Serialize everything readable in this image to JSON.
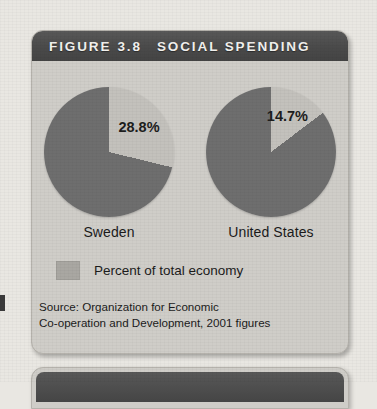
{
  "figure": {
    "header": {
      "prefix": "FIGURE",
      "number": "3.8",
      "title": "SOCIAL SPENDING"
    },
    "legend": {
      "label": "Percent of total economy",
      "swatch_color": "#a9a7a2"
    },
    "source": {
      "line1": "Source: Organization for Economic",
      "line2": "Co-operation and Development, 2001 figures"
    }
  },
  "chart_data": {
    "type": "pie",
    "title": "FIGURE 3.8  SOCIAL SPENDING",
    "ylabel": "",
    "xlabel": "",
    "legend": [
      "Percent of total economy"
    ],
    "legend_position": "bottom-left",
    "units": "percent of total economy",
    "source": "Source: Organization for Economic Co-operation and Development, 2001 figures",
    "colors": {
      "highlight_slice": "#c3c1bc",
      "remainder_slice": "#6e6e6e",
      "header_bar": "#4a4a4a",
      "card_background": "#cfcdc8"
    },
    "charts": [
      {
        "name": "Sweden",
        "value": 28.8,
        "value_label": "28.8%",
        "remainder": 71.2,
        "slices": [
          {
            "label": "28.8%",
            "value": 28.8,
            "color": "#c3c1bc"
          },
          {
            "label": "",
            "value": 71.2,
            "color": "#6e6e6e"
          }
        ]
      },
      {
        "name": "United States",
        "value": 14.7,
        "value_label": "14.7%",
        "remainder": 85.3,
        "slices": [
          {
            "label": "14.7%",
            "value": 14.7,
            "color": "#c3c1bc"
          },
          {
            "label": "",
            "value": 85.3,
            "color": "#6e6e6e"
          }
        ]
      }
    ]
  }
}
